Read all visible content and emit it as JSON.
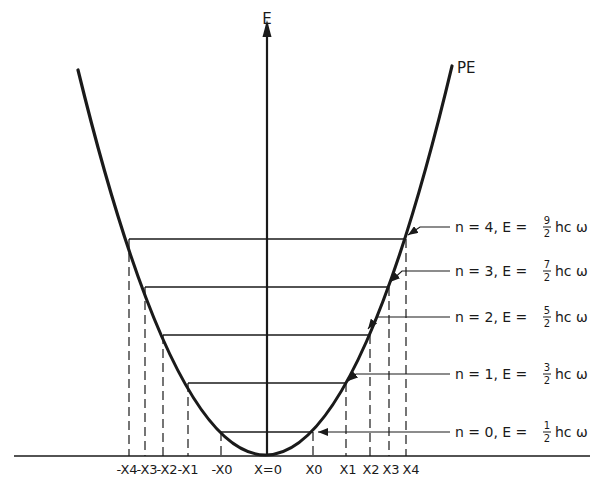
{
  "diagram": {
    "axis_labels": {
      "vertical": "E",
      "curve": "PE",
      "origin": "X=0"
    },
    "x_ticks_left": [
      "-X4",
      "-X3",
      "-X2",
      "-X1",
      "-X0"
    ],
    "x_ticks_right": [
      "X0",
      "X1",
      "X2",
      "X3",
      "X4"
    ],
    "levels": [
      {
        "n": "0",
        "label": "n = 0,  E =",
        "num": "1",
        "den": "2",
        "unit": "hc ω"
      },
      {
        "n": "1",
        "label": "n = 1,  E =",
        "num": "3",
        "den": "2",
        "unit": "hc ω"
      },
      {
        "n": "2",
        "label": "n = 2,  E =",
        "num": "5",
        "den": "2",
        "unit": "hc ω"
      },
      {
        "n": "3",
        "label": "n = 3,  E =",
        "num": "7",
        "den": "2",
        "unit": "hc ω"
      },
      {
        "n": "4",
        "label": "n = 4,  E =",
        "num": "9",
        "den": "2",
        "unit": "hc ω"
      }
    ],
    "colors": {
      "ink": "#1a1a1a",
      "background": "#ffffff"
    }
  }
}
